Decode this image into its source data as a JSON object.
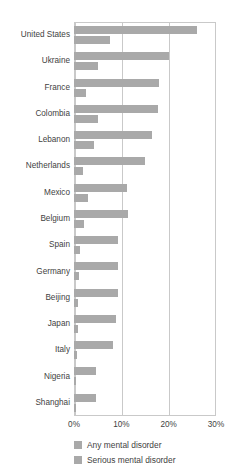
{
  "chart_data": {
    "type": "bar",
    "orientation": "horizontal",
    "title": "",
    "xlabel": "",
    "ylabel": "",
    "xlim": [
      0,
      30
    ],
    "xunit": "%",
    "grid": true,
    "legend_position": "bottom-left",
    "xticks": [
      "0%",
      "10%",
      "20%",
      "30%"
    ],
    "xtick_values": [
      0,
      10,
      20,
      30
    ],
    "categories": [
      "United States",
      "Ukraine",
      "France",
      "Colombia",
      "Lebanon",
      "Netherlands",
      "Mexico",
      "Belgium",
      "Spain",
      "Germany",
      "Beijing",
      "Japan",
      "Italy",
      "Nigeria",
      "Shanghai"
    ],
    "series": [
      {
        "name": "Any mental disorder",
        "color": "#a9a9a9",
        "values": [
          26.0,
          20.0,
          18.0,
          17.8,
          16.4,
          14.9,
          11.2,
          11.5,
          9.2,
          9.3,
          9.2,
          8.8,
          8.2,
          4.7,
          4.7
        ]
      },
      {
        "name": "Serious mental disorder",
        "color": "#a9a9a9",
        "values": [
          7.7,
          5.0,
          2.6,
          5.0,
          4.3,
          1.8,
          3.0,
          2.1,
          1.3,
          1.0,
          0.9,
          0.9,
          0.7,
          0.4,
          0.4
        ]
      }
    ]
  }
}
